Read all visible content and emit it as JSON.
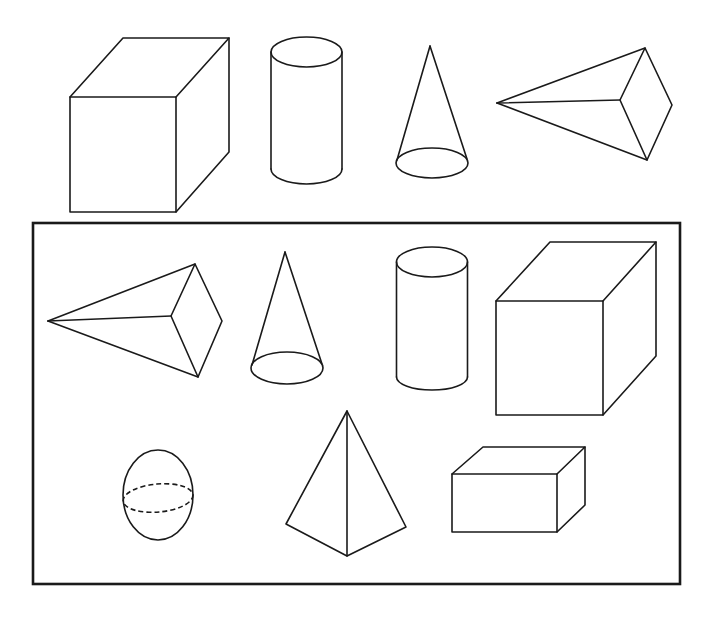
{
  "diagram": {
    "colors": {
      "line": "#1a1a1a",
      "background": "#ffffff"
    },
    "top_row": [
      {
        "id": "cube-top",
        "shape": "cube"
      },
      {
        "id": "cylinder-top",
        "shape": "cylinder"
      },
      {
        "id": "cone-top",
        "shape": "cone"
      },
      {
        "id": "pyramid-top",
        "shape": "square pyramid (sideways)"
      }
    ],
    "framed_group": {
      "frame": {
        "x": 33,
        "y": 223,
        "width": 647,
        "height": 361
      },
      "shapes": [
        {
          "id": "pyramid-framed",
          "shape": "square pyramid (sideways)"
        },
        {
          "id": "cone-framed",
          "shape": "cone"
        },
        {
          "id": "cylinder-framed",
          "shape": "cylinder"
        },
        {
          "id": "cube-framed",
          "shape": "cube"
        },
        {
          "id": "sphere-framed",
          "shape": "sphere"
        },
        {
          "id": "tetrahedron-framed",
          "shape": "triangular pyramid"
        },
        {
          "id": "cuboid-framed",
          "shape": "rectangular prism"
        }
      ]
    }
  }
}
